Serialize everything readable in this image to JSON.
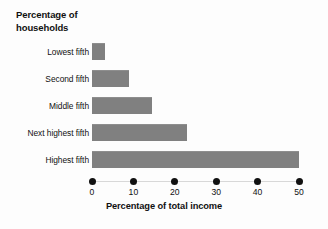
{
  "chart_data": {
    "type": "bar",
    "orientation": "horizontal",
    "title": "Percentage of\nhouseholds",
    "xlabel": "Percentage of total income",
    "ylabel": "Percentage of households",
    "categories": [
      "Lowest fifth",
      "Second fifth",
      "Middle fifth",
      "Next highest fifth",
      "Highest fifth"
    ],
    "values": [
      3.2,
      9,
      14.5,
      23,
      50
    ],
    "xlim": [
      0,
      50
    ],
    "xticks": [
      0,
      10,
      20,
      30,
      40,
      50
    ],
    "xtick_labels": [
      "0",
      "10",
      "20",
      "30",
      "40",
      "50"
    ],
    "grid": false,
    "legend": false,
    "bar_color": "#808080",
    "background_color": "#fdfdfd",
    "text_color": "#111111"
  }
}
